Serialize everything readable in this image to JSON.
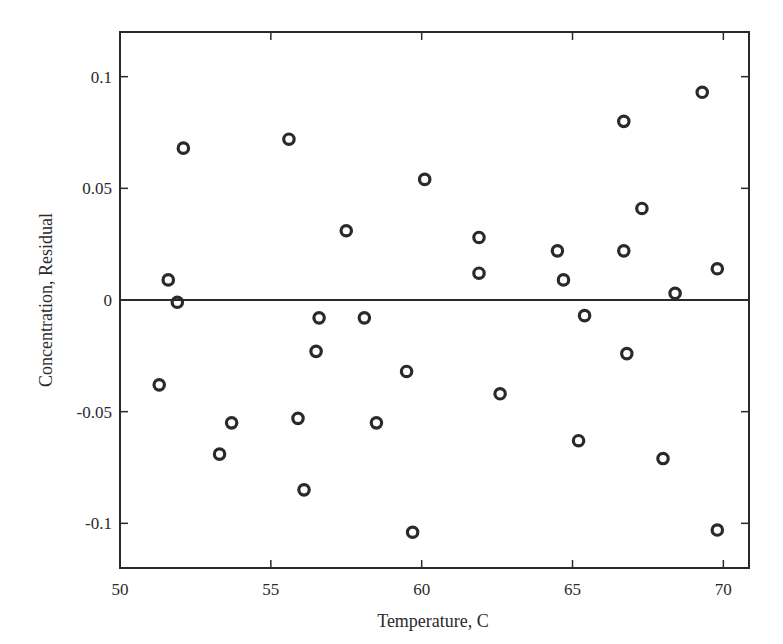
{
  "chart_data": {
    "type": "scatter",
    "title": "",
    "xlabel": "Temperature, C",
    "ylabel": "Concentration, Residual",
    "xlim": [
      50,
      70.85
    ],
    "ylim": [
      -0.12,
      0.12
    ],
    "xticks": [
      50,
      55,
      60,
      65,
      70
    ],
    "xtick_labels": [
      "50",
      "55",
      "60",
      "65",
      "70"
    ],
    "yticks": [
      -0.1,
      -0.05,
      0,
      0.05,
      0.1
    ],
    "ytick_labels": [
      "-0.1",
      "-0.05",
      "0",
      "0.05",
      "0.1"
    ],
    "grid": false,
    "legend": null,
    "reference_line": {
      "y": 0
    },
    "marker": "open-circle",
    "colors": {
      "marker": "#2a2a2a",
      "axes": "#2a2a2a",
      "background": "#ffffff"
    },
    "series": [
      {
        "name": "residuals",
        "points": [
          [
            52.1,
            0.068
          ],
          [
            51.6,
            0.009
          ],
          [
            51.9,
            -0.001
          ],
          [
            51.3,
            -0.038
          ],
          [
            53.3,
            -0.069
          ],
          [
            53.7,
            -0.055
          ],
          [
            55.6,
            0.072
          ],
          [
            55.9,
            -0.053
          ],
          [
            56.1,
            -0.085
          ],
          [
            56.5,
            -0.023
          ],
          [
            56.6,
            -0.008
          ],
          [
            57.5,
            0.031
          ],
          [
            58.1,
            -0.008
          ],
          [
            58.5,
            -0.055
          ],
          [
            59.5,
            -0.032
          ],
          [
            59.7,
            -0.104
          ],
          [
            60.1,
            0.054
          ],
          [
            61.9,
            0.028
          ],
          [
            61.9,
            0.012
          ],
          [
            62.6,
            -0.042
          ],
          [
            64.5,
            0.022
          ],
          [
            64.7,
            0.009
          ],
          [
            65.2,
            -0.063
          ],
          [
            65.4,
            -0.007
          ],
          [
            66.7,
            0.08
          ],
          [
            66.7,
            0.022
          ],
          [
            66.8,
            -0.024
          ],
          [
            67.3,
            0.041
          ],
          [
            68.0,
            -0.071
          ],
          [
            68.4,
            0.003
          ],
          [
            69.3,
            0.093
          ],
          [
            69.8,
            0.014
          ],
          [
            69.8,
            -0.103
          ]
        ]
      }
    ]
  }
}
